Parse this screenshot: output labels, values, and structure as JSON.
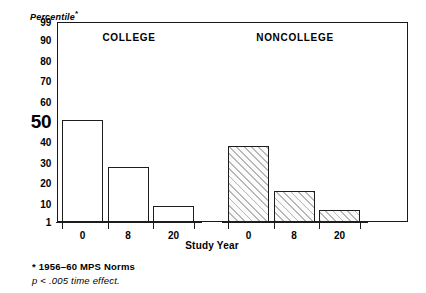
{
  "figure": {
    "yaxis_title": "Percentile",
    "yaxis_title_marker": "*",
    "xaxis_title": "Study Year",
    "footnote_star": "* 1956–60 MPS Norms",
    "footnote_p": "p < .005 time effect.",
    "frame_color": "#1a1a1a",
    "bar_outline_color": "#1d1d1d",
    "hatch_color": "#b7b7b7"
  },
  "chart_data": {
    "type": "bar",
    "title": "",
    "xlabel": "Study Year",
    "ylabel": "Percentile*",
    "ylim": [
      1,
      99
    ],
    "grid": false,
    "legend": "none",
    "ytick_labels": [
      "99",
      "90",
      "80",
      "70",
      "60",
      "50",
      "40",
      "30",
      "20",
      "10",
      "1"
    ],
    "ytick_values": [
      99,
      90,
      80,
      70,
      60,
      50,
      40,
      30,
      20,
      10,
      1
    ],
    "emphasized_ytick": "50",
    "categories": [
      "0",
      "8",
      "20"
    ],
    "panels": [
      {
        "name": "COLLEGE",
        "fill": "open",
        "values": [
          51,
          28,
          9
        ]
      },
      {
        "name": "NONCOLLEGE",
        "fill": "hatched",
        "values": [
          38,
          16,
          7
        ]
      }
    ],
    "annotations": [
      "* 1956–60 MPS Norms",
      "p < .005 time effect."
    ]
  }
}
